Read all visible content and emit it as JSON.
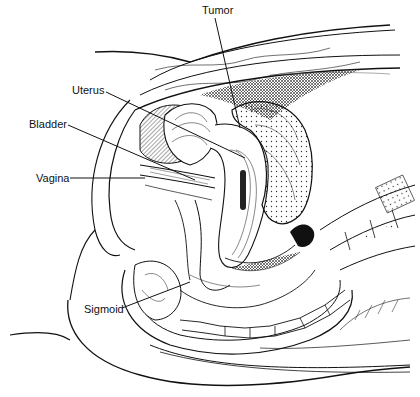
{
  "figure": {
    "labels": {
      "tumor": "Tumor",
      "uterus": "Uterus",
      "bladder": "Bladder",
      "vagina": "Vagina",
      "sigmoid": "Sigmoid"
    },
    "colors": {
      "line": "#111111",
      "background": "#ffffff"
    }
  }
}
